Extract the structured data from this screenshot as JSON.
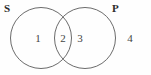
{
  "diagram": {
    "type": "venn-two-set",
    "background_color": "#fefefe",
    "stroke_color": "#5a5a5a",
    "label_color": "#2b2b2b",
    "number_color": "#444444",
    "sets": [
      {
        "id": "S",
        "label": "S",
        "label_position": "top-left",
        "center_x": 41,
        "center_y": 38,
        "radius": 30.5
      },
      {
        "id": "P",
        "label": "P",
        "label_position": "top-right",
        "center_x": 85,
        "center_y": 38,
        "radius": 30.5
      }
    ],
    "regions": [
      {
        "id": "region-1",
        "number": "1",
        "meaning": "S only",
        "x": 38,
        "y": 38
      },
      {
        "id": "region-2",
        "number": "2",
        "meaning": "S and P intersection",
        "x": 63,
        "y": 38
      },
      {
        "id": "region-3",
        "number": "3",
        "meaning": "P only",
        "x": 80,
        "y": 38
      },
      {
        "id": "region-4",
        "number": "4",
        "meaning": "outside both sets",
        "x": 130,
        "y": 38
      }
    ]
  }
}
